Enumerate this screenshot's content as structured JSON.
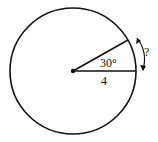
{
  "diagram": {
    "type": "circle-sector",
    "angle_label": "30°",
    "radius_label": "4",
    "arc_label": "?",
    "colors": {
      "stroke": "#111111",
      "background": "#ffffff"
    }
  }
}
